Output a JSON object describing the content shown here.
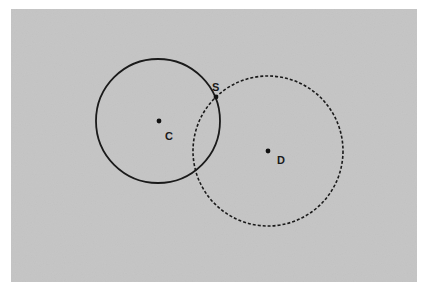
{
  "diagram": {
    "background": {
      "x": 11,
      "y": 9,
      "width": 406,
      "height": 273,
      "color": "#c4c4c4"
    },
    "circles": [
      {
        "name": "circle-C",
        "cx": 158,
        "cy": 121,
        "r": 62,
        "style": "solid",
        "color": "#1a1a1a"
      },
      {
        "name": "circle-D",
        "cx": 268,
        "cy": 151,
        "r": 75,
        "style": "dashed",
        "color": "#1a1a1a"
      }
    ],
    "points": [
      {
        "name": "C",
        "x": 159,
        "y": 121,
        "label": "C",
        "label_x": 165,
        "label_y": 140
      },
      {
        "name": "D",
        "x": 268,
        "y": 151,
        "label": "D",
        "label_x": 277,
        "label_y": 164
      },
      {
        "name": "S",
        "x": 216,
        "y": 97,
        "label": "S",
        "label_x": 212,
        "label_y": 91
      }
    ]
  }
}
